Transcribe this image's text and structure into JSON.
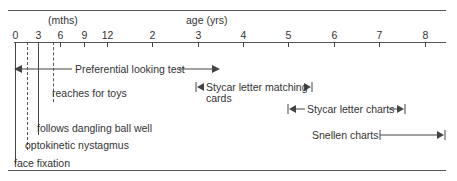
{
  "header": {
    "months_label": "(mths)",
    "years_label": "age (yrs)"
  },
  "axis": {
    "ticks": [
      {
        "label": "0",
        "x": 15
      },
      {
        "label": "3",
        "x": 38
      },
      {
        "label": "6",
        "x": 60
      },
      {
        "label": "9",
        "x": 84
      },
      {
        "label": "12",
        "x": 107
      },
      {
        "label": "2",
        "x": 152
      },
      {
        "label": "3",
        "x": 198
      },
      {
        "label": "4",
        "x": 243
      },
      {
        "label": "5",
        "x": 288
      },
      {
        "label": "6",
        "x": 334
      },
      {
        "label": "7",
        "x": 379
      },
      {
        "label": "8",
        "x": 425
      }
    ]
  },
  "milestones": {
    "face_fixation": "face fixation",
    "optokinetic": "optokinetic nystagmus",
    "follows_ball": "follows dangling ball well",
    "reaches_toys": "reaches for toys"
  },
  "tests": {
    "preferential": "Preferential looking test",
    "stycar_cards_1": "Stycar letter matching",
    "stycar_cards_2": "cards",
    "stycar_charts": "Stycar letter charts",
    "snellen": "Snellen charts"
  },
  "colors": {
    "ink": "#333333",
    "rule": "#555555",
    "background": "#ffffff"
  }
}
